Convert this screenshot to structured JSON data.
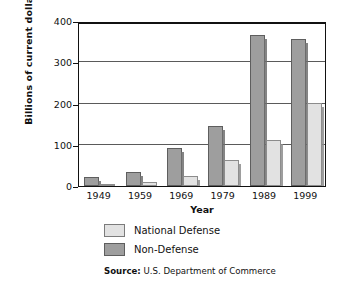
{
  "chart_data": {
    "type": "bar",
    "title": "",
    "xlabel": "Year",
    "ylabel": "Billions of current dollars",
    "categories": [
      "1949",
      "1959",
      "1969",
      "1979",
      "1989",
      "1999"
    ],
    "series": [
      {
        "name": "National Defense",
        "color": "#e2e2e2",
        "values": [
          3,
          9,
          25,
          64,
          112,
          201
        ]
      },
      {
        "name": "Non-Defense",
        "color": "#9e9e9e",
        "values": [
          21,
          35,
          93,
          146,
          366,
          357
        ]
      }
    ],
    "series_draw_order": [
      "Non-Defense",
      "National Defense"
    ],
    "ylim": [
      0,
      400
    ],
    "ytick_values": [
      0,
      100,
      200,
      300,
      400
    ],
    "ytick_labels": [
      "0",
      "100",
      "200",
      "300",
      "400"
    ],
    "grid": true,
    "grid_axis": "y",
    "legend_position": "below-axes"
  },
  "legend": {
    "items": [
      {
        "label": "National Defense",
        "swatch": "light-gray-square"
      },
      {
        "label": "Non-Defense",
        "swatch": "dark-gray-square"
      }
    ]
  },
  "source": {
    "prefix": "Source:",
    "text": "U.S. Department of Commerce"
  }
}
